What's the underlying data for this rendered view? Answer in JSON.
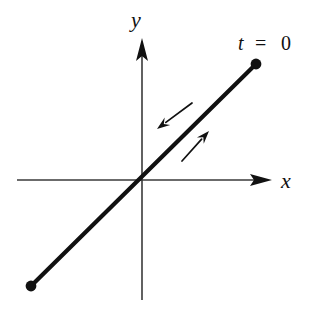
{
  "figure": {
    "background_color": "#ffffff",
    "width": 316,
    "height": 319
  },
  "axes": {
    "origin": {
      "x": 142,
      "y": 180
    },
    "color": "#3a3a3a",
    "stroke_width": 1.6,
    "x_axis": {
      "label": "x",
      "label_x": 286,
      "label_y": 188,
      "start_x": 17,
      "end_x": 272,
      "y": 180,
      "arrowhead": "solid-triangle-right"
    },
    "y_axis": {
      "label": "y",
      "label_x": 136,
      "label_y": 27,
      "x": 142,
      "start_y": 300,
      "end_y": 38,
      "arrowhead": "solid-triangle-up"
    }
  },
  "trajectory": {
    "color": "#111111",
    "stroke_width": 4.2,
    "start_point": {
      "x": 31,
      "y": 286
    },
    "end_point": {
      "x": 256,
      "y": 64
    },
    "endpoint_dot_radius": 5.4,
    "endpoint_dot_color": "#111111"
  },
  "annotations": {
    "parameter_label": {
      "variable": "t",
      "operator": "=",
      "value": "0",
      "x": 238,
      "y": 50
    },
    "direction_arrows": [
      {
        "name": "inbound-arrow",
        "direction": "down-left",
        "from": {
          "x": 192,
          "y": 103
        },
        "to": {
          "x": 157,
          "y": 129
        },
        "color": "#111111",
        "stroke_width": 1.7
      },
      {
        "name": "outbound-arrow",
        "direction": "up-right",
        "from": {
          "x": 182,
          "y": 161
        },
        "to": {
          "x": 209,
          "y": 131
        },
        "color": "#111111",
        "stroke_width": 1.7
      }
    ]
  }
}
